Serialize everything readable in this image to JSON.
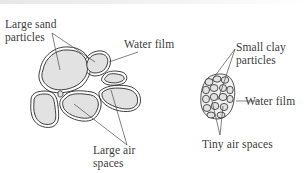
{
  "diagram": {
    "title": "",
    "left_cluster": {
      "name": "sand soil",
      "labels": {
        "particles_line1": "Large sand",
        "particles_line2": "particles",
        "water_film": "Water film",
        "air_line1": "Large air",
        "air_line2": "spaces"
      }
    },
    "right_cluster": {
      "name": "clay soil",
      "labels": {
        "particles_line1": "Small clay",
        "particles_line2": "particles",
        "water_film": "Water film",
        "air": "Tiny air spaces"
      }
    },
    "colors": {
      "particle_fill": "#e2e2e2",
      "outline": "#2a2a2a",
      "leader_line": "#4a4a4a",
      "text": "#3c3c3c"
    }
  }
}
